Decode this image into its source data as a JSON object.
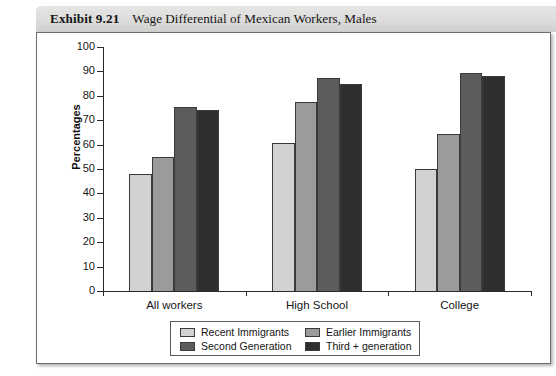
{
  "caption": {
    "exhibit_label": "Exhibit 9.21",
    "title": "Wage Differential of Mexican Workers, Males"
  },
  "colors": {
    "recent_immigrants": "#d2d2d2",
    "earlier_immigrants": "#9b9b9b",
    "second_generation": "#5c5c5c",
    "third_plus_generation": "#2f2f2f",
    "axis": "#2b2b2b",
    "frame_border": "#6d6d6d",
    "header_band": "#dcdcda"
  },
  "chart_data": {
    "type": "bar",
    "title": "Wage Differential of Mexican Workers, Males",
    "xlabel": "",
    "ylabel": "Percentages",
    "categories": [
      "All workers",
      "High School",
      "College"
    ],
    "series": [
      {
        "name": "Recent Immigrants",
        "values": [
          48,
          60.5,
          50
        ]
      },
      {
        "name": "Earlier Immigrants",
        "values": [
          55,
          77.5,
          64.5
        ]
      },
      {
        "name": "Second Generation",
        "values": [
          75.5,
          87.5,
          89.5
        ]
      },
      {
        "name": "Third + generation",
        "values": [
          74,
          85,
          88
        ]
      }
    ],
    "ylim": [
      0,
      100
    ],
    "yticks": [
      0,
      10,
      20,
      30,
      40,
      50,
      60,
      70,
      80,
      90,
      100
    ],
    "ytick_labels": [
      "0",
      "10",
      "20",
      "30",
      "40",
      "50",
      "60",
      "70",
      "80",
      "90",
      "100"
    ],
    "grid": false,
    "legend_position": "bottom"
  },
  "legend": {
    "entries": [
      {
        "label": "Recent Immigrants",
        "color": "#d2d2d2"
      },
      {
        "label": "Earlier Immigrants",
        "color": "#9b9b9b"
      },
      {
        "label": "Second Generation",
        "color": "#5c5c5c"
      },
      {
        "label": "Third + generation",
        "color": "#2f2f2f"
      }
    ]
  }
}
